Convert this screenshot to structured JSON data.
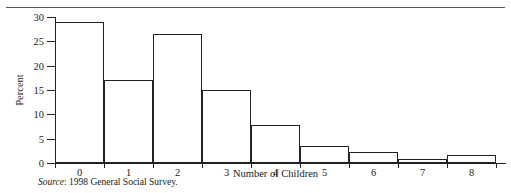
{
  "figure": {
    "source_prefix": "Source",
    "source_text": ": 1998 General Social Survey.",
    "truncated_caption": ""
  },
  "chart_data": {
    "type": "bar",
    "title": "",
    "xlabel": "Number of Children",
    "ylabel": "Percent",
    "categories": [
      "0",
      "1",
      "2",
      "3",
      "4",
      "5",
      "6",
      "7",
      "8"
    ],
    "values": [
      29,
      17,
      26.5,
      15,
      7.8,
      3.5,
      2.2,
      0.8,
      1.7
    ],
    "ylim": [
      0,
      30
    ],
    "yticks": [
      "0",
      "5",
      "10",
      "15",
      "20",
      "25",
      "30"
    ],
    "ytick_values": [
      0,
      5,
      10,
      15,
      20,
      25,
      30
    ],
    "grid": false,
    "legend": "none",
    "bar_fill": "#ffffff",
    "bar_edge": "#222222"
  }
}
